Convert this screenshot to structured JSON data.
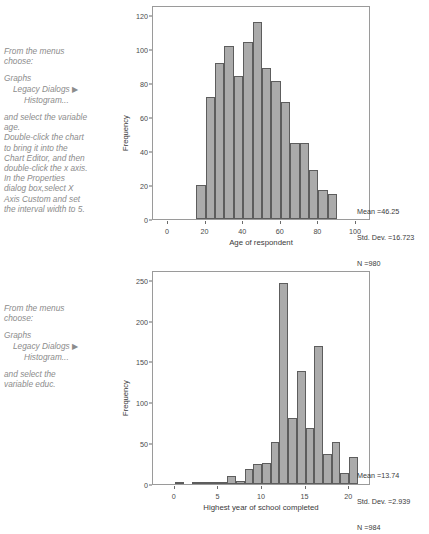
{
  "panels": [
    {
      "instructions": {
        "line1": "From the menus",
        "line2": "choose:",
        "menu1": "Graphs",
        "menu2": "Legacy Dialogs",
        "menu2_arrow": "▶",
        "menu3": "Histogram...",
        "body": [
          "and select the variable",
          "age.",
          "Double-click the chart",
          "to bring it into the",
          "Chart Editor, and then",
          "double-click the x axis.",
          "In the Properties",
          "dialog box,select X",
          "Axis Custom and set",
          "the interval width to 5."
        ]
      },
      "stats": {
        "mean": "Mean =46.25",
        "std_dev": "Std. Dev. =16.723",
        "n": "N =980"
      }
    },
    {
      "instructions": {
        "line1": "From the menus",
        "line2": "choose:",
        "menu1": "Graphs",
        "menu2": "Legacy Dialogs",
        "menu2_arrow": "▶",
        "menu3": "Histogram...",
        "body": [
          "and select the",
          "variable educ."
        ]
      },
      "stats": {
        "mean": "Mean =13.74",
        "std_dev": "Std. Dev. =2.939",
        "n": "N =984"
      }
    }
  ],
  "colors": {
    "bar_fill": "#ababab",
    "bar_stroke": "#5d5d5d",
    "frame": "#9a9a9a",
    "instruction_text": "#8c8c8c"
  },
  "chart_data": [
    {
      "type": "bar",
      "title": "",
      "xlabel": "Age of respondent",
      "ylabel": "Frequency",
      "xlim": [
        -8,
        108
      ],
      "ylim": [
        0,
        126
      ],
      "xticks": [
        0,
        20,
        40,
        60,
        80,
        100
      ],
      "yticks": [
        0,
        20,
        40,
        60,
        80,
        100,
        120
      ],
      "grid": false,
      "bin_width": 5,
      "bin_starts": [
        15,
        20,
        25,
        30,
        35,
        40,
        45,
        50,
        55,
        60,
        65,
        70,
        75,
        80,
        85
      ],
      "categories": [
        "15-20",
        "20-25",
        "25-30",
        "30-35",
        "35-40",
        "40-45",
        "45-50",
        "50-55",
        "55-60",
        "60-65",
        "65-70",
        "70-75",
        "75-80",
        "80-85",
        "85-90"
      ],
      "values": [
        20,
        72,
        92,
        102,
        84,
        104,
        116,
        89,
        81,
        69,
        45,
        45,
        29,
        17,
        15
      ],
      "annotation": [
        "Mean =46.25",
        "Std. Dev. =16.723",
        "N =980"
      ]
    },
    {
      "type": "bar",
      "title": "",
      "xlabel": "Highest year of school completed",
      "ylabel": "Frequency",
      "xlim": [
        -2.5,
        22.5
      ],
      "ylim": [
        0,
        262
      ],
      "xticks": [
        0,
        5,
        10,
        15,
        20
      ],
      "yticks": [
        0,
        50,
        100,
        150,
        200,
        250
      ],
      "grid": false,
      "bin_width": 1,
      "bin_starts": [
        0,
        1,
        2,
        3,
        4,
        5,
        6,
        7,
        8,
        9,
        10,
        11,
        12,
        13,
        14,
        15,
        16,
        17,
        18,
        19,
        20
      ],
      "categories": [
        "0",
        "1",
        "2",
        "3",
        "4",
        "5",
        "6",
        "7",
        "8",
        "9",
        "10",
        "11",
        "12",
        "13",
        "14",
        "15",
        "16",
        "17",
        "18",
        "19",
        "20"
      ],
      "values": [
        1,
        0,
        2,
        1,
        1,
        2,
        10,
        4,
        18,
        24,
        26,
        52,
        246,
        81,
        138,
        68,
        169,
        37,
        51,
        14,
        33
      ],
      "annotation": [
        "Mean =13.74",
        "Std. Dev. =2.939",
        "N =984"
      ]
    }
  ]
}
